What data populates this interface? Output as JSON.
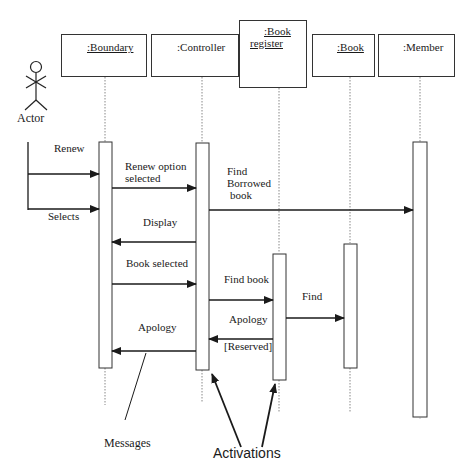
{
  "diagram": {
    "type": "UML sequence diagram",
    "actor": {
      "label": "Actor"
    },
    "objects": [
      {
        "id": "boundary",
        "label": ":Boundary",
        "underlined": true
      },
      {
        "id": "controller",
        "label": ":Controller",
        "underlined": false
      },
      {
        "id": "book_register",
        "label_line1": ":Book",
        "label_line2": "register",
        "underlined": true
      },
      {
        "id": "book",
        "label": ":Book",
        "underlined": true
      },
      {
        "id": "member",
        "label": ":Member",
        "underlined": false
      }
    ],
    "messages": [
      {
        "from": "actor",
        "to": "boundary",
        "label": "Renew"
      },
      {
        "from": "actor",
        "to": "boundary",
        "label": "Selects"
      },
      {
        "from": "boundary",
        "to": "controller",
        "label_line1": "Renew option",
        "label_line2": "selected"
      },
      {
        "from": "controller",
        "to": "member",
        "label_line1": "Find",
        "label_line2": "Borrowed",
        "label_line3": "book"
      },
      {
        "from": "controller",
        "to": "boundary",
        "label": "Display"
      },
      {
        "from": "boundary",
        "to": "controller",
        "label": "Book selected"
      },
      {
        "from": "controller",
        "to": "book_register",
        "label": "Find book"
      },
      {
        "from": "book_register",
        "to": "book",
        "label": "Find"
      },
      {
        "from": "book_register",
        "to": "controller",
        "label": "Apology",
        "guard": "[Reserved]"
      },
      {
        "from": "controller",
        "to": "boundary",
        "label": "Apology"
      }
    ],
    "callouts": {
      "messages": "Messages",
      "activations": "Activations"
    }
  }
}
